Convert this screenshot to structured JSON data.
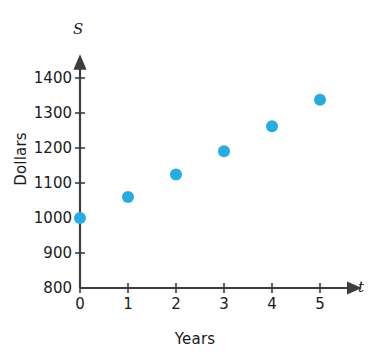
{
  "chart_data": {
    "type": "scatter",
    "title": "",
    "xlabel": "Years",
    "ylabel": "Dollars",
    "x_var_symbol": "t",
    "y_var_symbol": "S",
    "x": [
      0,
      1,
      2,
      3,
      4,
      5
    ],
    "values": [
      1000,
      1060,
      1124,
      1191,
      1262,
      1338
    ],
    "series": [
      {
        "name": "Savings balance",
        "x": [
          0,
          1,
          2,
          3,
          4,
          5
        ],
        "values": [
          1000,
          1060,
          1124,
          1191,
          1262,
          1338
        ]
      }
    ],
    "xlim": [
      0,
      5.6
    ],
    "ylim": [
      800,
      1430
    ],
    "x_ticks": [
      0,
      1,
      2,
      3,
      4,
      5
    ],
    "x_tick_labels": [
      "0",
      "1",
      "2",
      "3",
      "4",
      "5"
    ],
    "y_ticks": [
      800,
      900,
      1000,
      1100,
      1200,
      1300,
      1400
    ],
    "y_tick_labels": [
      "800",
      "900",
      "1000",
      "1100",
      "1200",
      "1300",
      "1400"
    ],
    "grid": false,
    "legend": null,
    "legend_position": "none",
    "marker": "circle",
    "marker_color": "#29ABE2",
    "axis_color": "#3d3d3d",
    "text_color": "#1a1a1a",
    "background_color": "#ffffff",
    "x_axis_arrow": true,
    "y_axis_arrow": true,
    "annotations": []
  }
}
